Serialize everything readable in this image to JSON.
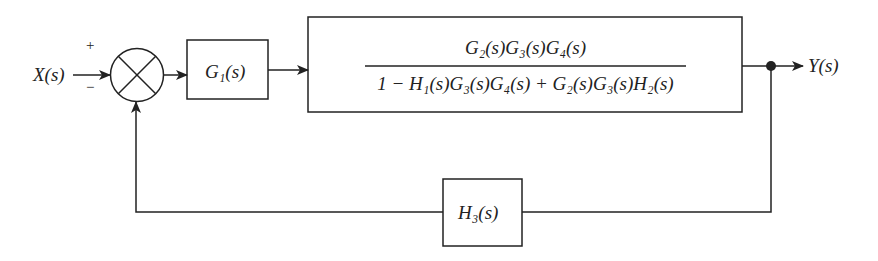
{
  "diagram": {
    "type": "block-diagram",
    "input": {
      "label": "X(s)"
    },
    "output": {
      "label": "Y(s)"
    },
    "summing_junction": {
      "plus_sign": "+",
      "minus_sign": "−"
    },
    "blocks": [
      {
        "id": "g1",
        "label": "G₁(s)"
      },
      {
        "id": "forward",
        "numerator": "G₂(s)G₃(s)G₄(s)",
        "denominator": "1 − H₁(s)G₃(s)G₄(s) + G₂(s)G₃(s)H₂(s)"
      },
      {
        "id": "h3",
        "label": "H₃(s)"
      }
    ],
    "connections": [
      {
        "from": "X(s)",
        "to": "summing_junction",
        "sign": "+"
      },
      {
        "from": "summing_junction",
        "to": "g1"
      },
      {
        "from": "g1",
        "to": "forward"
      },
      {
        "from": "forward",
        "to": "Y(s)"
      },
      {
        "from": "Y(s)",
        "to": "h3",
        "type": "feedback"
      },
      {
        "from": "h3",
        "to": "summing_junction",
        "sign": "−"
      }
    ],
    "colors": {
      "line": "#222222",
      "background": "#ffffff"
    }
  }
}
